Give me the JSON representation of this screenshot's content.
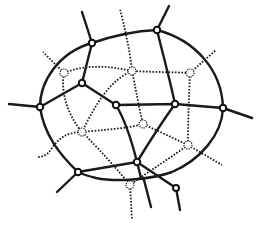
{
  "diagram": {
    "type": "network-graph",
    "colors": {
      "line": "#1a1a1a",
      "background": "#ffffff"
    },
    "solid_nodes": [
      {
        "id": "A",
        "x": 92,
        "y": 43
      },
      {
        "id": "B",
        "x": 157,
        "y": 30
      },
      {
        "id": "C",
        "x": 223,
        "y": 108
      },
      {
        "id": "D",
        "x": 137,
        "y": 162
      },
      {
        "id": "E",
        "x": 78,
        "y": 172
      },
      {
        "id": "F",
        "x": 40,
        "y": 107
      },
      {
        "id": "G",
        "x": 82,
        "y": 83
      },
      {
        "id": "H",
        "x": 116,
        "y": 105
      },
      {
        "id": "I",
        "x": 175,
        "y": 104
      }
    ],
    "hollow_nodes": [
      {
        "id": "J",
        "x": 64,
        "y": 73
      },
      {
        "id": "K",
        "x": 132,
        "y": 71
      },
      {
        "id": "L",
        "x": 190,
        "y": 73
      },
      {
        "id": "M",
        "x": 82,
        "y": 132
      },
      {
        "id": "N",
        "x": 143,
        "y": 124
      },
      {
        "id": "O",
        "x": 188,
        "y": 145
      },
      {
        "id": "P",
        "x": 130,
        "y": 185
      }
    ]
  }
}
